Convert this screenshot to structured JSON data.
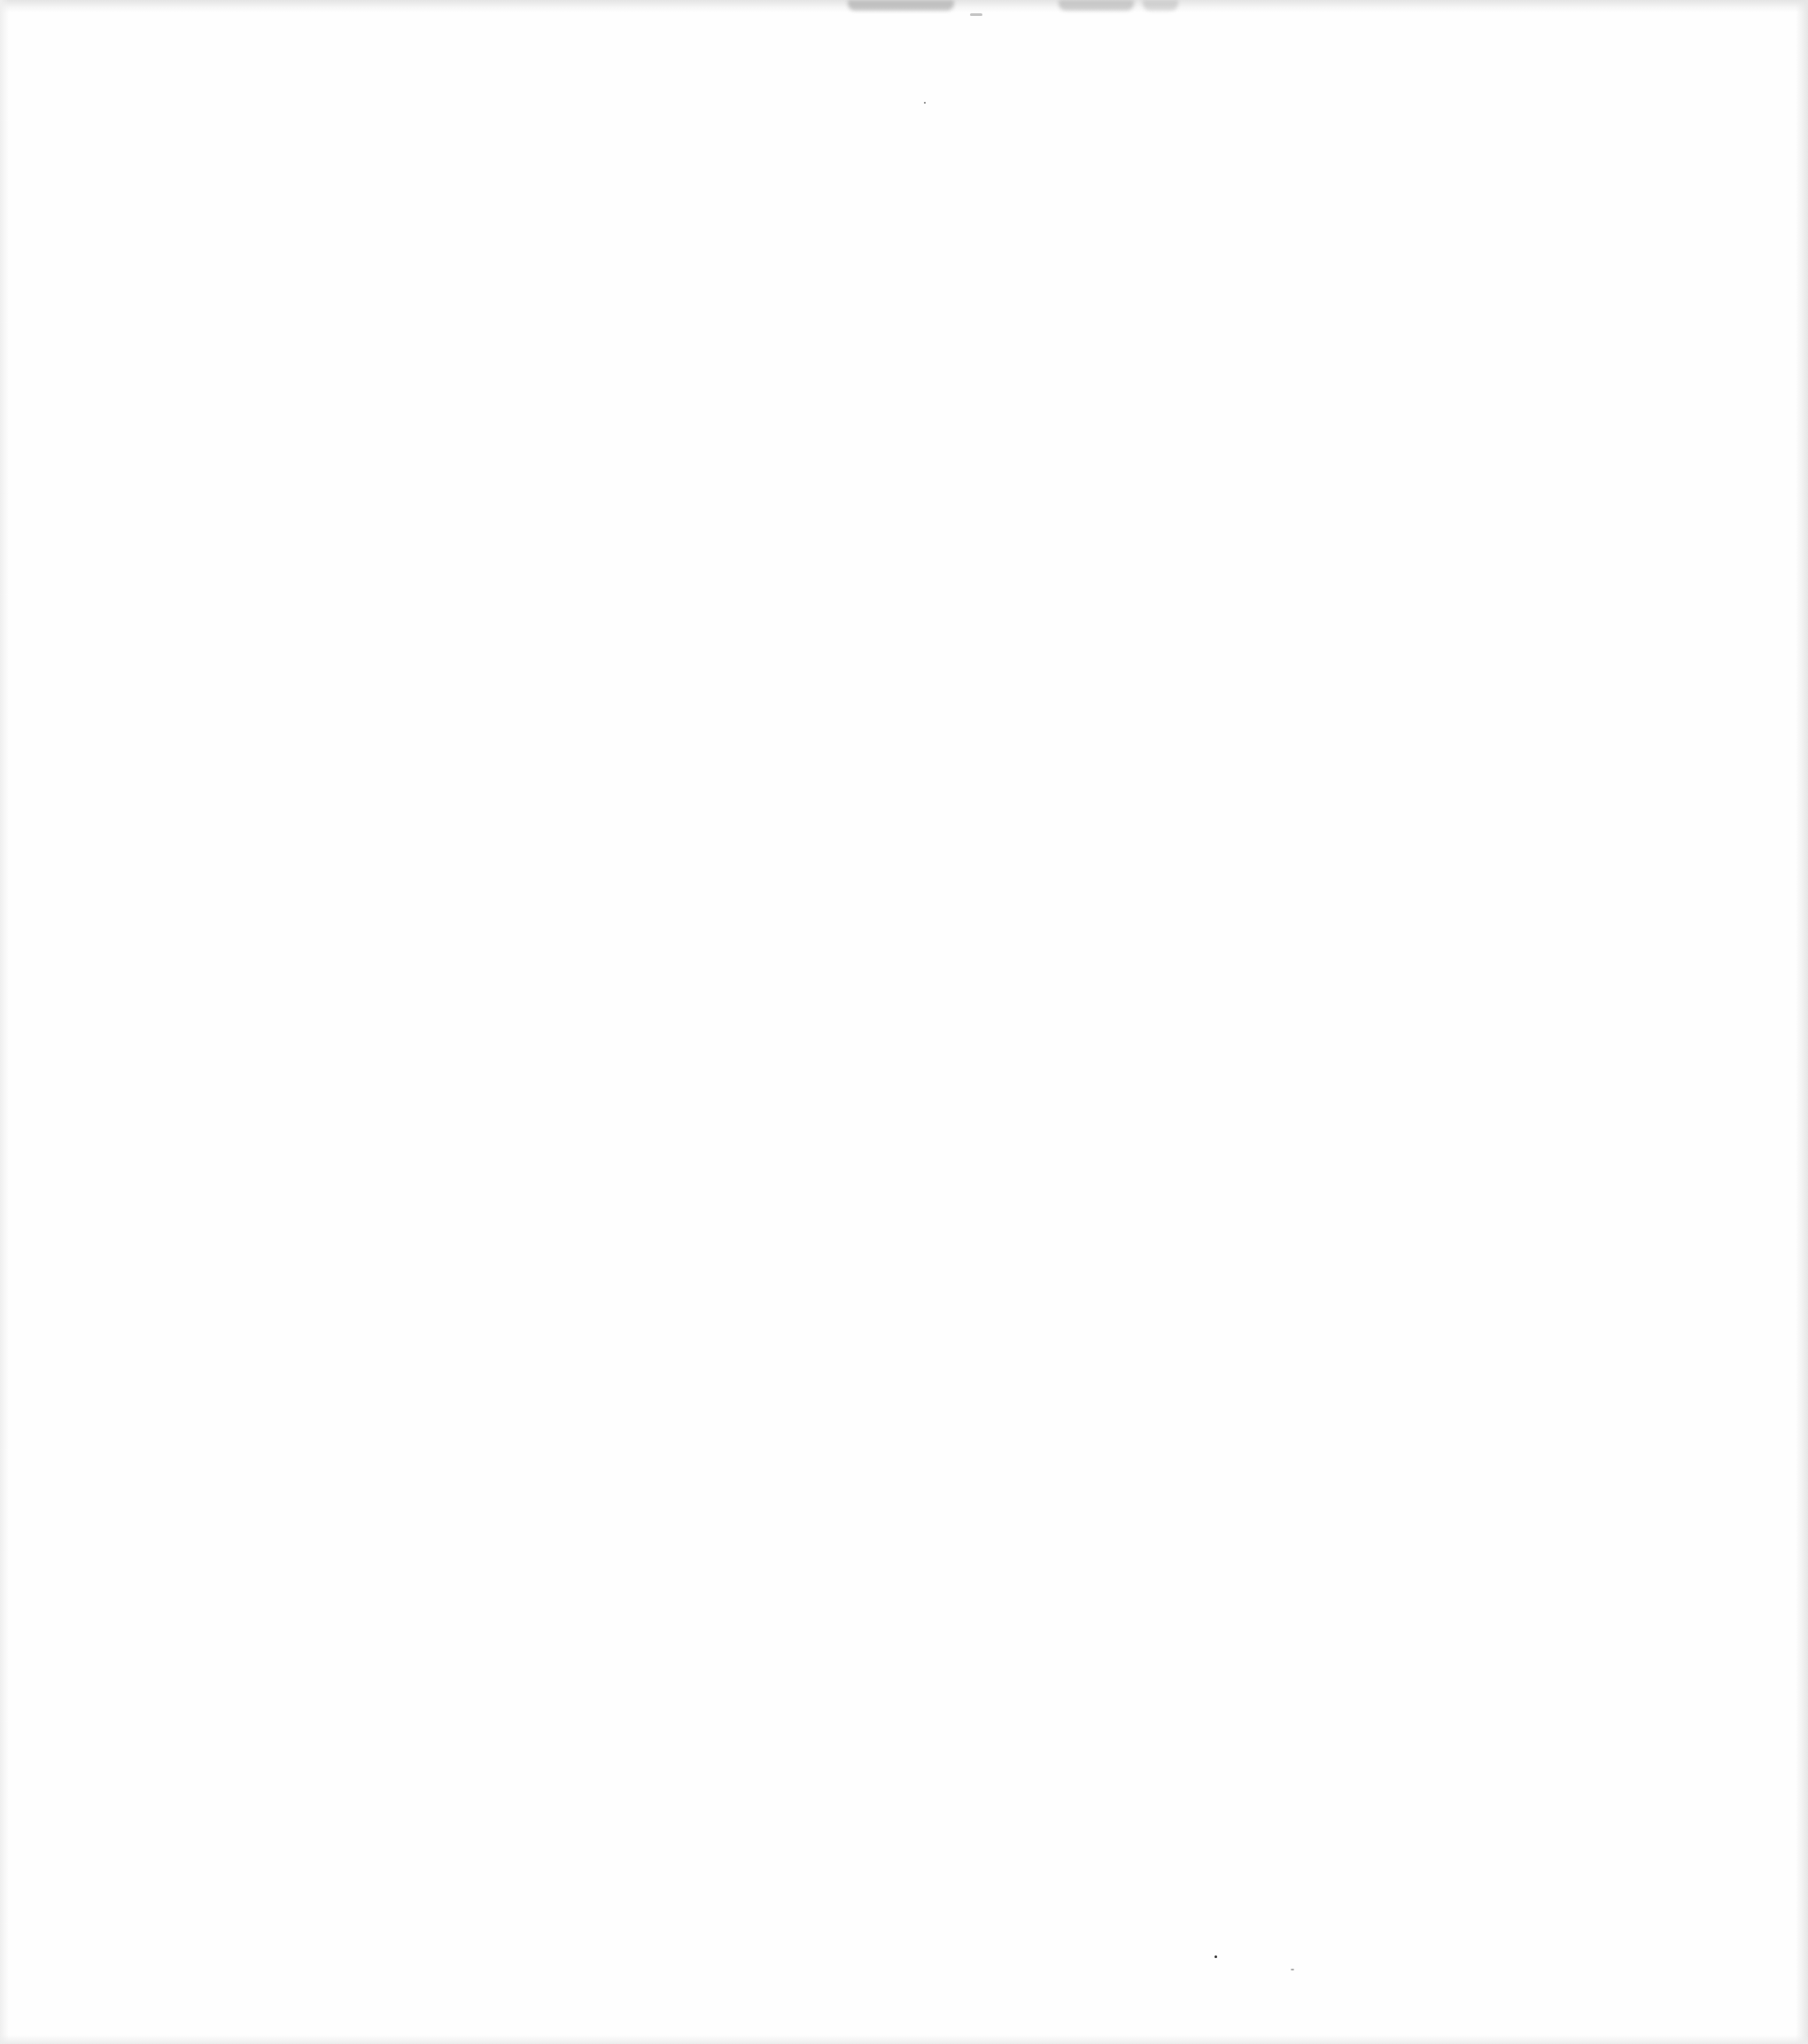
{
  "document": {
    "type": "blank scanned page",
    "visible_text": ""
  }
}
